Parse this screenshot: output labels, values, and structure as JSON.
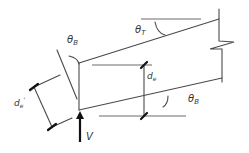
{
  "diagram": {
    "labels": {
      "theta_top": {
        "main": "θ",
        "sub": "T"
      },
      "theta_b_end": {
        "main": "θ",
        "sub": "B"
      },
      "theta_b_bottom": {
        "main": "θ",
        "sub": "B"
      },
      "de": {
        "main": "d",
        "sub": "e"
      },
      "de_prime": {
        "main": "d",
        "sub": "e",
        "prime": "'"
      },
      "shear": "V"
    },
    "colors": {
      "line": "#4a4a4a",
      "tick": "#111111",
      "text": "#333333",
      "background": "#ffffff"
    }
  }
}
